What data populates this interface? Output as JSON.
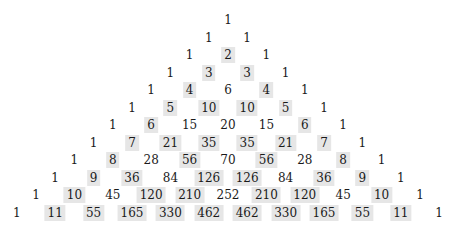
{
  "highlight_color": "#e6e6e6",
  "layout": {
    "center_x": 228,
    "top_y": 20,
    "row_step": 17.5,
    "col_half_step": 19.2
  },
  "rows": [
    {
      "values": [
        1
      ],
      "highlighted": [
        false
      ]
    },
    {
      "values": [
        1,
        1
      ],
      "highlighted": [
        false,
        false
      ]
    },
    {
      "values": [
        1,
        2,
        1
      ],
      "highlighted": [
        false,
        true,
        false
      ]
    },
    {
      "values": [
        1,
        3,
        3,
        1
      ],
      "highlighted": [
        false,
        true,
        true,
        false
      ]
    },
    {
      "values": [
        1,
        4,
        6,
        4,
        1
      ],
      "highlighted": [
        false,
        true,
        false,
        true,
        false
      ]
    },
    {
      "values": [
        1,
        5,
        10,
        10,
        5,
        1
      ],
      "highlighted": [
        false,
        true,
        true,
        true,
        true,
        false
      ]
    },
    {
      "values": [
        1,
        6,
        15,
        20,
        15,
        6,
        1
      ],
      "highlighted": [
        false,
        true,
        false,
        false,
        false,
        true,
        false
      ]
    },
    {
      "values": [
        1,
        7,
        21,
        35,
        35,
        21,
        7,
        1
      ],
      "highlighted": [
        false,
        true,
        true,
        true,
        true,
        true,
        true,
        false
      ]
    },
    {
      "values": [
        1,
        8,
        28,
        56,
        70,
        56,
        28,
        8,
        1
      ],
      "highlighted": [
        false,
        true,
        false,
        true,
        false,
        true,
        false,
        true,
        false
      ]
    },
    {
      "values": [
        1,
        9,
        36,
        84,
        126,
        126,
        84,
        36,
        9,
        1
      ],
      "highlighted": [
        false,
        true,
        true,
        false,
        true,
        true,
        false,
        true,
        true,
        false
      ]
    },
    {
      "values": [
        1,
        10,
        45,
        120,
        210,
        252,
        210,
        120,
        45,
        10,
        1
      ],
      "highlighted": [
        false,
        true,
        false,
        true,
        true,
        false,
        true,
        true,
        false,
        true,
        false
      ]
    },
    {
      "values": [
        1,
        11,
        55,
        165,
        330,
        462,
        462,
        330,
        165,
        55,
        11,
        1
      ],
      "highlighted": [
        false,
        true,
        true,
        true,
        true,
        true,
        true,
        true,
        true,
        true,
        true,
        false
      ]
    }
  ]
}
